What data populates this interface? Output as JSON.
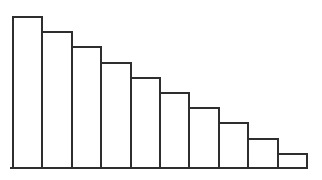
{
  "chart_data": {
    "type": "bar",
    "title": "",
    "xlabel": "",
    "ylabel": "",
    "categories": [
      "",
      "",
      "",
      "",
      "",
      "",
      "",
      "",
      "",
      ""
    ],
    "values": [
      10,
      9,
      8,
      7,
      6,
      5,
      4,
      3,
      2,
      1
    ],
    "ylim": [
      0,
      10
    ],
    "grid": false,
    "legend": false,
    "axis_tick_labels_visible": false,
    "baseline_axis_visible": true,
    "bar_fill_color": "#ffffff",
    "bar_stroke_color": "#2e2e2e",
    "axis_line_color": "#2e2e2e",
    "background_color": "#ffffff"
  }
}
